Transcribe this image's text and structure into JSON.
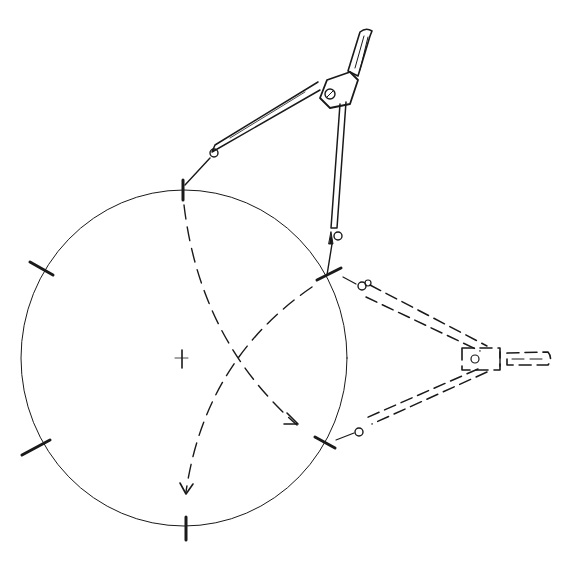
{
  "illustration": {
    "subject": "Dividing a circle into six equal parts with a compass",
    "ink_color": "#1a1a1a",
    "background_color": "#ffffff",
    "division_count": 6,
    "compass_positions": [
      "solid",
      "dashed"
    ],
    "arcs": [
      "arc-from-top-mark",
      "arc-from-upper-right-mark"
    ]
  }
}
